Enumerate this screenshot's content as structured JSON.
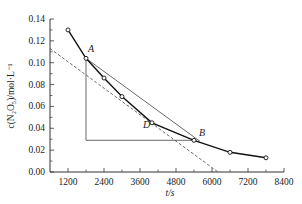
{
  "chart_data": {
    "type": "line",
    "title": "",
    "xlabel": "t/s",
    "ylabel": "c(N2O5)/mol·L⁻¹",
    "xlim": [
      600,
      8400
    ],
    "ylim": [
      0.0,
      0.14
    ],
    "x_ticks": [
      "1200",
      "2400",
      "3600",
      "4800",
      "6000",
      "7200",
      "8400"
    ],
    "y_ticks": [
      "0.00",
      "0.02",
      "0.04",
      "0.06",
      "0.08",
      "0.10",
      "0.12",
      "0.14"
    ],
    "grid": false,
    "legend": null,
    "series": [
      {
        "name": "c(N2O5) vs t",
        "style": "solid-thick-with-open-markers",
        "x": [
          1200,
          1800,
          2400,
          3000,
          4000,
          5400,
          6600,
          7800
        ],
        "y": [
          0.13,
          0.104,
          0.086,
          0.069,
          0.045,
          0.029,
          0.018,
          0.013
        ]
      }
    ],
    "annotations": [
      {
        "label": "A",
        "x": 1800,
        "y": 0.104
      },
      {
        "label": "D",
        "x": 4000,
        "y": 0.045
      },
      {
        "label": "B",
        "x": 5400,
        "y": 0.029
      }
    ],
    "guide_lines": [
      {
        "name": "secant-AB",
        "style": "thin-solid",
        "from": [
          1800,
          0.104
        ],
        "to": [
          5600,
          0.028
        ]
      },
      {
        "name": "tangent-at-D",
        "style": "dashed",
        "from": [
          600,
          0.113
        ],
        "to": [
          6200,
          0.0
        ]
      },
      {
        "name": "vertical-from-A",
        "style": "thin-solid",
        "from": [
          1800,
          0.104
        ],
        "to": [
          1800,
          0.029
        ]
      },
      {
        "name": "horizontal-to-B",
        "style": "thin-solid",
        "from": [
          1800,
          0.029
        ],
        "to": [
          5400,
          0.029
        ]
      }
    ]
  },
  "labels": {
    "x_axis_title": "t/s",
    "y_axis_title": "c(N₂O₅)/mol·L⁻¹",
    "point_a": "A",
    "point_b": "B",
    "point_d": "D"
  }
}
